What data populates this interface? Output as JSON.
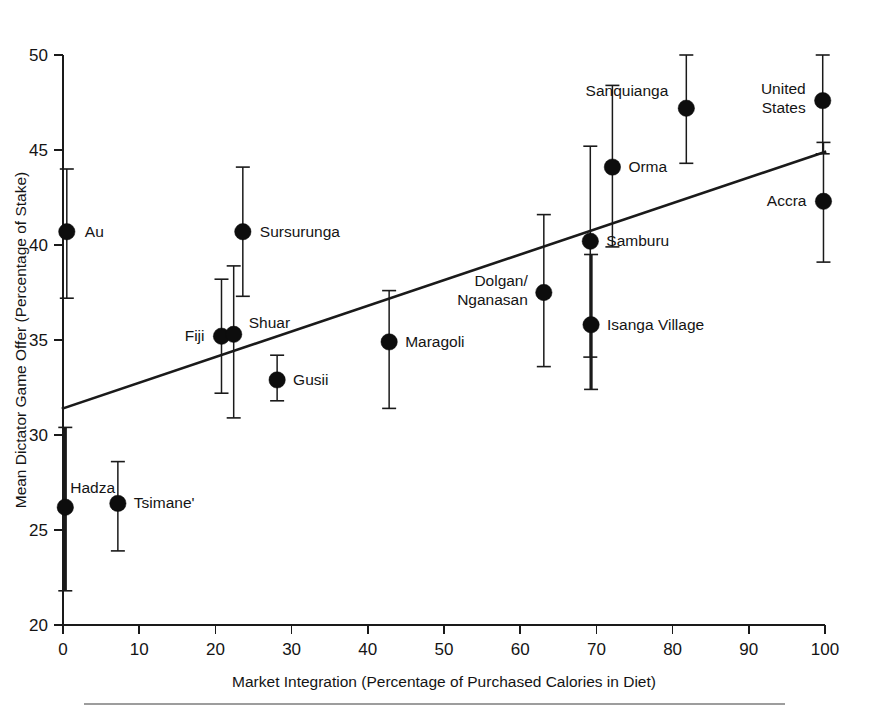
{
  "chart_data": {
    "type": "scatter",
    "title": "",
    "xlabel": "Market Integration (Percentage of Purchased Calories in Diet)",
    "ylabel": "Mean Dictator Game Offer (Percentage of Stake)",
    "xlim": [
      0,
      100
    ],
    "ylim": [
      20,
      50
    ],
    "xticks": [
      0,
      10,
      20,
      30,
      40,
      50,
      60,
      70,
      80,
      90,
      100
    ],
    "yticks": [
      20,
      25,
      30,
      35,
      40,
      45,
      50
    ],
    "xtick_labels": [
      "0",
      "10",
      "20",
      "30",
      "40",
      "50",
      "60",
      "70",
      "80",
      "90",
      "100"
    ],
    "ytick_labels": [
      "20",
      "25",
      "30",
      "35",
      "40",
      "45",
      "50"
    ],
    "grid": false,
    "legend": "none",
    "error_bars": "vertical",
    "points": [
      {
        "label": "Au",
        "x": 0.5,
        "y": 40.7,
        "y_low": 37.2,
        "y_high": 44.0,
        "label_dx": 18,
        "label_dy": 5,
        "label_anchor": "start",
        "thick_bar": false
      },
      {
        "label": "Hadza",
        "x": 0.3,
        "y": 26.2,
        "y_low": 21.8,
        "y_high": 30.4,
        "label_dx": 5,
        "label_dy": -14,
        "label_anchor": "start",
        "thick_bar": true
      },
      {
        "label": "Tsimane'",
        "x": 7.2,
        "y": 26.4,
        "y_low": 23.9,
        "y_high": 28.6,
        "label_dx": 16,
        "label_dy": 5,
        "label_anchor": "start",
        "thick_bar": false
      },
      {
        "label": "Fiji",
        "x": 20.8,
        "y": 35.2,
        "y_low": 32.2,
        "y_high": 38.2,
        "label_dx": -17,
        "label_dy": 5,
        "label_anchor": "end",
        "thick_bar": false
      },
      {
        "label": "Shuar",
        "x": 22.4,
        "y": 35.3,
        "y_low": 30.9,
        "y_high": 38.9,
        "label_dx": 15,
        "label_dy": -6,
        "label_anchor": "start",
        "thick_bar": false
      },
      {
        "label": "Sursurunga",
        "x": 23.6,
        "y": 40.7,
        "y_low": 37.3,
        "y_high": 44.1,
        "label_dx": 17,
        "label_dy": 5,
        "label_anchor": "start",
        "thick_bar": false
      },
      {
        "label": "Gusii",
        "x": 28.1,
        "y": 32.9,
        "y_low": 31.8,
        "y_high": 34.2,
        "label_dx": 16,
        "label_dy": 5,
        "label_anchor": "start",
        "thick_bar": false
      },
      {
        "label": "Maragoli",
        "x": 42.8,
        "y": 34.9,
        "y_low": 31.4,
        "y_high": 37.6,
        "label_dx": 16,
        "label_dy": 5,
        "label_anchor": "start",
        "thick_bar": false
      },
      {
        "label": "Dolgan/\nNganasan",
        "label_lines": [
          "Dolgan/",
          "Nganasan"
        ],
        "x": 63.1,
        "y": 37.5,
        "y_low": 33.6,
        "y_high": 41.6,
        "label_dx": -16,
        "label_dy": -7,
        "label_anchor": "end",
        "thick_bar": false
      },
      {
        "label": "Samburu",
        "x": 69.2,
        "y": 40.2,
        "y_low": 34.1,
        "y_high": 45.2,
        "label_dx": 16,
        "label_dy": 5,
        "label_anchor": "start",
        "thick_bar": false
      },
      {
        "label": "Isanga Village",
        "x": 69.3,
        "y": 35.8,
        "y_low": 32.4,
        "y_high": 39.5,
        "label_dx": 16,
        "label_dy": 5,
        "label_anchor": "start",
        "thick_bar": true
      },
      {
        "label": "Orma",
        "x": 72.1,
        "y": 44.1,
        "y_low": 39.9,
        "y_high": 48.4,
        "label_dx": 16,
        "label_dy": 5,
        "label_anchor": "start",
        "thick_bar": false
      },
      {
        "label": "Sanquianga",
        "x": 81.8,
        "y": 47.2,
        "y_low": 44.3,
        "y_high": 50.1,
        "label_dx": -18,
        "label_dy": -12,
        "label_anchor": "end",
        "thick_bar": false
      },
      {
        "label": "United\nStates",
        "label_lines": [
          "United",
          "States"
        ],
        "x": 99.7,
        "y": 47.6,
        "y_low": 44.8,
        "y_high": 50.2,
        "label_dx": -17,
        "label_dy": -7,
        "label_anchor": "end",
        "thick_bar": false
      },
      {
        "label": "Accra",
        "x": 99.8,
        "y": 42.3,
        "y_low": 39.1,
        "y_high": 45.4,
        "label_dx": -17,
        "label_dy": 5,
        "label_anchor": "end",
        "thick_bar": false
      }
    ],
    "trend_line": {
      "x_start": 0,
      "y_start": 31.4,
      "x_end": 100,
      "y_end": 44.9,
      "style": "solid"
    }
  },
  "figure": {
    "has_bottom_rule": true
  }
}
